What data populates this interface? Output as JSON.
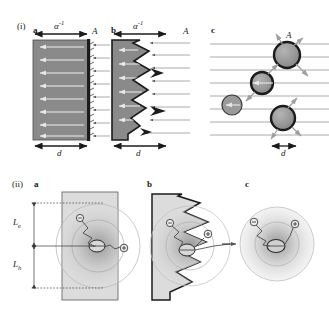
{
  "figure": {
    "type": "scientific-schematic",
    "background_color": "#ffffff",
    "width": 329,
    "height": 315,
    "rows": [
      {
        "tag": "(i)",
        "topic": "light-absorption",
        "panels": [
          {
            "tag": "a",
            "name": "flat-slab-absorber",
            "geometry": "flat planar slab",
            "top_label": "α",
            "top_label_sup": "-1",
            "corner_label": "A",
            "bottom_label": "d",
            "incoming_rays": 8,
            "internal_arrows": 8,
            "fill_color": "#8a8a8a",
            "edge_color": "#1b1b1b"
          },
          {
            "tag": "b",
            "name": "textured-slab-absorber",
            "geometry": "slab with rough sawtooth front surface",
            "top_label": "α",
            "top_label_sup": "-1",
            "corner_label": "A",
            "bottom_label": "d",
            "incoming_rays": 8,
            "internal_arrows": 6,
            "fill_color": "#8a8a8a",
            "edge_color": "#1b1b1b"
          },
          {
            "tag": "c",
            "name": "nanoparticle-absorber",
            "geometry": "array of spherical nanoparticles",
            "corner_label": "A",
            "bottom_label": "d",
            "particle_count": 4,
            "incoming_rays": 8,
            "particle_fill": "#9a9a9a",
            "particle_ring": "#1b1b1b"
          }
        ]
      },
      {
        "tag": "(ii)",
        "topic": "carrier-collection",
        "panels": [
          {
            "tag": "a",
            "name": "flat-slab-carrier-collection",
            "geometry": "flat planar slab",
            "dimension_labels": [
              "L",
              "L"
            ],
            "dimension_label_subs": [
              "e",
              "h"
            ],
            "electron_symbol": "⊖",
            "hole_symbol": "⊕",
            "cloud_color": "#c9c9c9",
            "slab_fill": "#d8d8d8"
          },
          {
            "tag": "b",
            "name": "textured-slab-carrier-collection",
            "geometry": "slab with rough sawtooth front surface",
            "electron_symbol": "⊖",
            "hole_symbol": "⊕",
            "cloud_color": "#c9c9c9",
            "slab_fill": "#d8d8d8"
          },
          {
            "tag": "c",
            "name": "nanoparticle-carrier-collection",
            "geometry": "single spherical nanoparticle",
            "electron_symbol": "⊖",
            "hole_symbol": "⊕",
            "cloud_color": "#c9c9c9"
          }
        ]
      }
    ]
  }
}
